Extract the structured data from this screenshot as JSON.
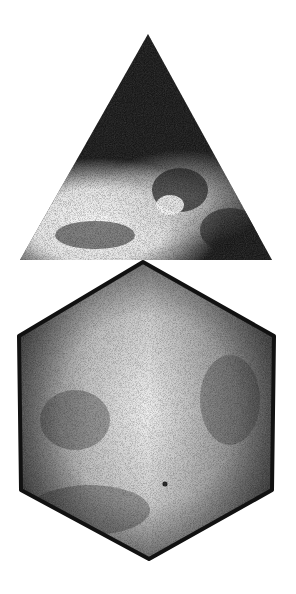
{
  "figure": {
    "background": "#ffffff",
    "shapes": [
      {
        "name": "triangle",
        "fill_dark": "#111111",
        "fill_light": "#f4f4f4",
        "points": "148,34 272,260 20,260"
      },
      {
        "name": "hexagon",
        "fill_dark": "#141414",
        "fill_light": "#ededed",
        "points": "143,262 274,336 272,490 149,559 21,490 19,336"
      }
    ]
  }
}
